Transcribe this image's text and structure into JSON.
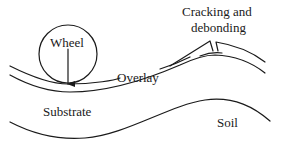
{
  "diagram": {
    "labels": {
      "wheel": "Wheel",
      "overlay": "Overlay",
      "cracking_line1": "Cracking and",
      "cracking_line2": "debonding",
      "substrate": "Substrate",
      "soil": "Soil"
    },
    "colors": {
      "stroke": "#1a1a1a",
      "background": "#ffffff"
    }
  }
}
